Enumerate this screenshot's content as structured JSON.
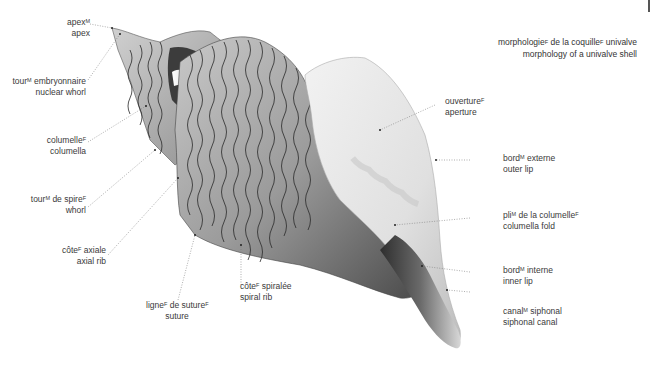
{
  "title": {
    "fr_main": "morphologie",
    "fr_main_gender": "F",
    "fr_mid": " de la coquille",
    "fr_mid_gender": "F",
    "fr_end": " univalve",
    "en": "morphology of a univalve shell"
  },
  "labels": [
    {
      "id": "apex",
      "fr": "apex",
      "gender": "M",
      "fr_rest": "",
      "gender2": "",
      "en": "apex"
    },
    {
      "id": "nuclear-whorl",
      "fr": "tour",
      "gender": "M",
      "fr_rest": " embryonnaire",
      "gender2": "",
      "en": "nuclear whorl"
    },
    {
      "id": "columella",
      "fr": "columelle",
      "gender": "F",
      "fr_rest": "",
      "gender2": "",
      "en": "columella"
    },
    {
      "id": "whorl",
      "fr": "tour",
      "gender": "M",
      "fr_rest": " de spire",
      "gender2": "F",
      "en": "whorl"
    },
    {
      "id": "axial-rib",
      "fr": "côte",
      "gender": "F",
      "fr_rest": " axiale",
      "gender2": "",
      "en": "axial rib"
    },
    {
      "id": "suture",
      "fr": "ligne",
      "gender": "F",
      "fr_rest": " de suture",
      "gender2": "F",
      "en": "suture"
    },
    {
      "id": "spiral-rib",
      "fr": "côte",
      "gender": "F",
      "fr_rest": " spiralée",
      "gender2": "",
      "en": "spiral rib"
    },
    {
      "id": "aperture",
      "fr": "ouverture",
      "gender": "F",
      "fr_rest": "",
      "gender2": "",
      "en": "aperture"
    },
    {
      "id": "outer-lip",
      "fr": "bord",
      "gender": "M",
      "fr_rest": " externe",
      "gender2": "",
      "en": "outer lip"
    },
    {
      "id": "columella-fold",
      "fr": "pli",
      "gender": "M",
      "fr_rest": " de la columelle",
      "gender2": "F",
      "en": "columella fold"
    },
    {
      "id": "inner-lip",
      "fr": "bord",
      "gender": "M",
      "fr_rest": " interne",
      "gender2": "",
      "en": "inner lip"
    },
    {
      "id": "siphonal-canal",
      "fr": "canal",
      "gender": "M",
      "fr_rest": " siphonal",
      "gender2": "",
      "en": "siphonal canal"
    }
  ],
  "colors": {
    "leader_line": "#777777",
    "shell_dark": "#3a3a3a",
    "shell_mid": "#8a8a8a",
    "shell_light": "#e8e8e8",
    "rib": "#2a2a2a"
  }
}
